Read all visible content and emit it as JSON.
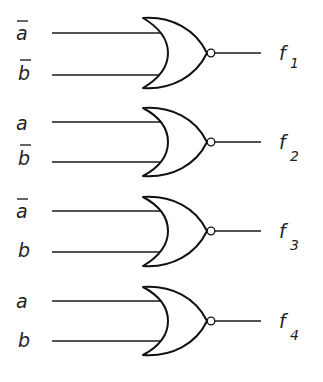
{
  "colors": {
    "line": "#111111",
    "background": "#ffffff"
  },
  "gates": [
    {
      "type": "NOR",
      "inputs": [
        {
          "var": "a",
          "negated": true
        },
        {
          "var": "b",
          "negated": true
        }
      ],
      "output": {
        "name": "f",
        "subscript": "1"
      }
    },
    {
      "type": "NOR",
      "inputs": [
        {
          "var": "a",
          "negated": false
        },
        {
          "var": "b",
          "negated": true
        }
      ],
      "output": {
        "name": "f",
        "subscript": "2"
      }
    },
    {
      "type": "NOR",
      "inputs": [
        {
          "var": "a",
          "negated": true
        },
        {
          "var": "b",
          "negated": false
        }
      ],
      "output": {
        "name": "f",
        "subscript": "3"
      }
    },
    {
      "type": "NOR",
      "inputs": [
        {
          "var": "a",
          "negated": false
        },
        {
          "var": "b",
          "negated": false
        }
      ],
      "output": {
        "name": "f",
        "subscript": "4"
      }
    }
  ]
}
